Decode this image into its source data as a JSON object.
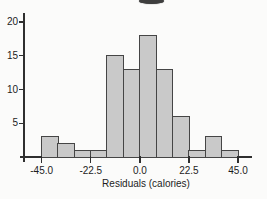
{
  "chart_data": {
    "type": "bar",
    "subtype": "histogram",
    "title": "",
    "xlabel": "Residuals (calories)",
    "ylabel": "",
    "bin_edges": [
      -45,
      -37.5,
      -30,
      -22.5,
      -15,
      -7.5,
      0,
      7.5,
      15,
      22.5,
      30,
      37.5,
      45
    ],
    "counts": [
      3,
      2,
      1,
      1,
      15,
      13,
      18,
      13,
      6,
      1,
      3,
      1
    ],
    "x_ticks": [
      {
        "value": -45,
        "label": "-45.0"
      },
      {
        "value": -22.5,
        "label": "-22.5"
      },
      {
        "value": 0,
        "label": "0.0"
      },
      {
        "value": 22.5,
        "label": "22.5"
      },
      {
        "value": 45,
        "label": "45.0"
      }
    ],
    "y_ticks": [
      {
        "value": 5,
        "label": "5"
      },
      {
        "value": 10,
        "label": "10"
      },
      {
        "value": 15,
        "label": "15"
      },
      {
        "value": 20,
        "label": "20"
      }
    ],
    "xlim": [
      -45,
      45
    ],
    "ylim": [
      0,
      20
    ],
    "grid": false,
    "legend": null,
    "colors": {
      "bar_fill": "#c9c9c9",
      "bar_border": "#454545",
      "axis": "#2f2f2f",
      "text": "#1d1d1d",
      "background": "#fbfbfa"
    }
  },
  "artifacts": {
    "top_cropped_glyph": "bottom fragment of cut-off title character",
    "top_cropped_glyph_color": "#3e3e3e"
  }
}
